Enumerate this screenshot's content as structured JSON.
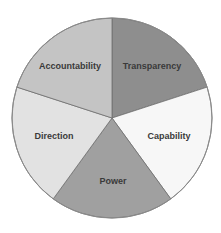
{
  "chart_data": {
    "type": "pie",
    "title": "",
    "categories": [
      "Transparency",
      "Capability",
      "Power",
      "Direction",
      "Accountability"
    ],
    "values": [
      20,
      20,
      20,
      20,
      20
    ],
    "start_angle_deg": 0,
    "direction": "clockwise",
    "colors": [
      "#8e8e8e",
      "#f7f7f7",
      "#a0a0a0",
      "#e2e2e2",
      "#c4c4c4"
    ],
    "stroke_color": "#6e6e6e",
    "label_color": "#3a3a3a",
    "legend": "none",
    "labels_inside": true
  },
  "labels": {
    "transparency": "Transparency",
    "capability": "Capability",
    "power": "Power",
    "direction": "Direction",
    "accountability": "Accountability"
  }
}
